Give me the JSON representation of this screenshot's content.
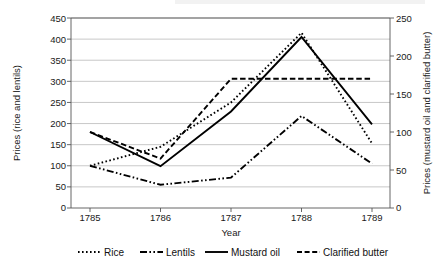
{
  "chart_data": {
    "type": "line",
    "title": "",
    "xlabel": "Year",
    "ylabel": "Prices (rice and lentils)",
    "y2label": "Prices (mustard oil and clarified butter)",
    "categories": [
      "1785",
      "1786",
      "1787",
      "1788",
      "1789"
    ],
    "x": [
      1785,
      1786,
      1787,
      1788,
      1789
    ],
    "ylim": [
      0,
      450
    ],
    "y2lim": [
      0,
      250
    ],
    "yticks": [
      0,
      50,
      100,
      150,
      200,
      250,
      300,
      350,
      400,
      450
    ],
    "y2ticks": [
      0,
      50,
      100,
      150,
      200,
      250
    ],
    "grid": true,
    "legend_position": "bottom",
    "series": [
      {
        "name": "Rice",
        "axis": "left",
        "style": "dotted",
        "values": [
          100,
          145,
          250,
          415,
          153
        ]
      },
      {
        "name": "Lentils",
        "axis": "left",
        "style": "dash-dot-dot",
        "values": [
          100,
          55,
          72,
          218,
          105
        ]
      },
      {
        "name": "Mustard oil",
        "axis": "right",
        "style": "solid",
        "values": [
          100,
          55,
          127,
          225,
          110
        ]
      },
      {
        "name": "Clarified butter",
        "axis": "right",
        "style": "dashed",
        "values": [
          100,
          65,
          170,
          170,
          170
        ]
      }
    ]
  },
  "axes": {
    "left": {
      "title": "Prices (rice and lentils)",
      "ticks": [
        "0",
        "50",
        "100",
        "150",
        "200",
        "250",
        "300",
        "350",
        "400",
        "450"
      ]
    },
    "right": {
      "title": "Prices (mustard oil and clarified butter)",
      "ticks": [
        "0",
        "50",
        "100",
        "150",
        "200",
        "250"
      ]
    },
    "bottom": {
      "title": "Year",
      "ticks": [
        "1785",
        "1786",
        "1787",
        "1788",
        "1789"
      ]
    }
  },
  "legend": {
    "items": [
      {
        "label": "Rice",
        "marker": "dotted-line-swatch"
      },
      {
        "label": "Lentils",
        "marker": "dash-dot-dot-line-swatch"
      },
      {
        "label": "Mustard oil",
        "marker": "solid-line-swatch"
      },
      {
        "label": "Clarified butter",
        "marker": "dashed-line-swatch"
      }
    ]
  },
  "colors": {
    "series": "#000000",
    "grid": "#b0b0b0",
    "axis": "#555555",
    "text": "#1a1a1a",
    "background": "#ffffff"
  }
}
